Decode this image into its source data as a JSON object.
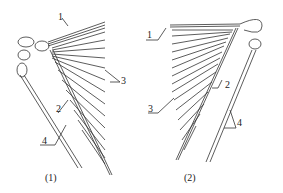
{
  "figure": {
    "panels": [
      {
        "caption": "(1)",
        "labels": {
          "l1": "1",
          "l2": "2",
          "l3": "3",
          "l4": "4"
        }
      },
      {
        "caption": "(2)",
        "labels": {
          "l1": "1",
          "l2": "2",
          "l3": "3",
          "l4": "4"
        }
      }
    ],
    "colors": {
      "line": "#333333",
      "background": "#ffffff"
    }
  }
}
